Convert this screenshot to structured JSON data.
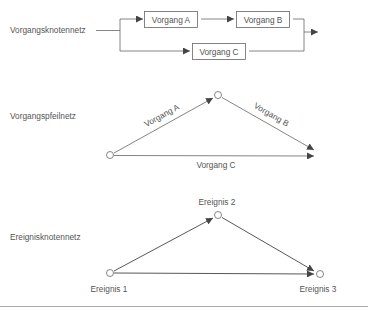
{
  "diagram": {
    "colors": {
      "line": "#666666",
      "text": "#555555",
      "divider": "#aaaaaa"
    },
    "sections": [
      {
        "id": "vkn",
        "label": "Vorgangsknotennetz",
        "nodes": [
          {
            "id": "A",
            "label": "Vorgang A"
          },
          {
            "id": "B",
            "label": "Vorgang B"
          },
          {
            "id": "C",
            "label": "Vorgang C"
          }
        ]
      },
      {
        "id": "vpn",
        "label": "Vorgangspfeilnetz",
        "edges": [
          {
            "id": "A",
            "label": "Vorgang A"
          },
          {
            "id": "B",
            "label": "Vorgang B"
          },
          {
            "id": "C",
            "label": "Vorgang C"
          }
        ]
      },
      {
        "id": "ekn",
        "label": "Ereignisknotennetz",
        "events": [
          {
            "id": "1",
            "label": "Ereignis 1"
          },
          {
            "id": "2",
            "label": "Ereignis 2"
          },
          {
            "id": "3",
            "label": "Ereignis 3"
          }
        ]
      }
    ]
  }
}
